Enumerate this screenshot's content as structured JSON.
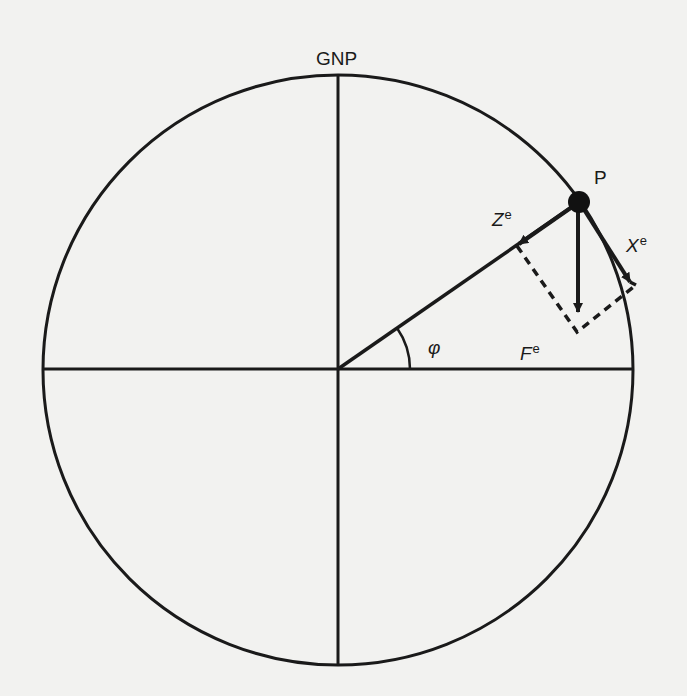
{
  "diagram": {
    "type": "geomagnetic field component diagram",
    "labels": {
      "pole": "GNP",
      "point": "P",
      "z_symbol": "Z",
      "z_super": "e",
      "x_symbol": "X",
      "x_super": "e",
      "f_symbol": "F",
      "f_super": "e",
      "angle": "φ"
    },
    "colors": {
      "background": "#f2f2f0",
      "ink": "#1a1a1a"
    },
    "geometry": {
      "circle_center": [
        338,
        370
      ],
      "circle_radius": 295,
      "point_P": [
        579,
        202
      ],
      "z_component_end": [
        517,
        246
      ],
      "x_component_end": [
        636,
        285
      ],
      "f_vector_end": [
        577,
        332
      ]
    }
  }
}
